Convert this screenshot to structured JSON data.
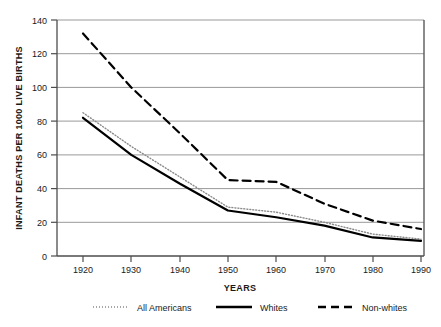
{
  "chart_data": {
    "type": "line",
    "title": "",
    "xlabel": "YEARS",
    "ylabel": "INFANT DEATHS PER 1000 LIVE BIRTHS",
    "x": [
      1920,
      1930,
      1940,
      1950,
      1960,
      1970,
      1980,
      1990
    ],
    "xticklabels": [
      "1920",
      "1930",
      "1940",
      "1950",
      "1960",
      "1970",
      "1980",
      "1990"
    ],
    "yticklabels": [
      "0",
      "20",
      "40",
      "60",
      "80",
      "100",
      "120",
      "140"
    ],
    "yticks": [
      0,
      20,
      40,
      60,
      80,
      100,
      120,
      140
    ],
    "xlim": [
      1915,
      1995
    ],
    "ylim": [
      0,
      140
    ],
    "grid": "horizontal",
    "legend_position": "below",
    "series": [
      {
        "name": "All Americans",
        "style": "dotted",
        "color": "#8a8a8a",
        "values": [
          85,
          65,
          47,
          29,
          26,
          20,
          13,
          10
        ]
      },
      {
        "name": "Whites",
        "style": "solid",
        "color": "#000000",
        "values": [
          82,
          60,
          43,
          27,
          23,
          18,
          11,
          9
        ]
      },
      {
        "name": "Non-whites",
        "style": "dashed",
        "color": "#000000",
        "values": [
          132,
          100,
          73,
          45,
          44,
          31,
          21,
          16
        ]
      }
    ]
  },
  "axis": {
    "y_label_text": "INFANT DEATHS PER 1000 LIVE BIRTHS",
    "x_label_text": "YEARS"
  },
  "legend": {
    "items": [
      {
        "label": "All Americans",
        "marker": "dotted-line-swatch"
      },
      {
        "label": "Whites",
        "marker": "solid-line-swatch"
      },
      {
        "label": "Non-whites",
        "marker": "dashed-line-swatch"
      }
    ]
  }
}
